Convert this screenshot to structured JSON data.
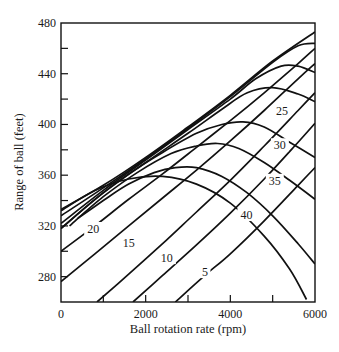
{
  "chart_data": {
    "type": "line",
    "title": "",
    "xlabel": "Ball rotation rate (rpm)",
    "ylabel": "Range of ball (feet)",
    "xlim": [
      0,
      6000
    ],
    "ylim": [
      260,
      480
    ],
    "grid": false,
    "legend": "none (curves labeled inline)",
    "x_ticks": [
      0,
      2000,
      4000,
      6000
    ],
    "x_minor_ticks": [
      1000,
      3000,
      5000
    ],
    "y_ticks": [
      280,
      320,
      360,
      400,
      440,
      480
    ],
    "y_minor_ticks": [
      300,
      340,
      380,
      420,
      460
    ],
    "x_tick_labels": [
      "0",
      "2000",
      "4000",
      "6000"
    ],
    "y_tick_labels": [
      "280",
      "320",
      "360",
      "400",
      "440",
      "480"
    ],
    "series": [
      {
        "name": "arch-top-1",
        "label": "",
        "points": [
          [
            0,
            333
          ],
          [
            1000,
            352
          ],
          [
            2000,
            374
          ],
          [
            3000,
            398
          ],
          [
            4000,
            423
          ],
          [
            5000,
            450
          ],
          [
            6000,
            473
          ]
        ]
      },
      {
        "name": "arch-top-2",
        "label": "",
        "points": [
          [
            0,
            328
          ],
          [
            1000,
            350
          ],
          [
            2000,
            373
          ],
          [
            3000,
            397
          ],
          [
            4000,
            422
          ],
          [
            5000,
            449
          ],
          [
            5600,
            462
          ],
          [
            6000,
            464
          ]
        ]
      },
      {
        "name": "arch-top-3",
        "label": "",
        "points": [
          [
            0,
            322
          ],
          [
            1000,
            348
          ],
          [
            2000,
            372
          ],
          [
            3000,
            396
          ],
          [
            4000,
            420
          ],
          [
            4600,
            436
          ],
          [
            5200,
            446
          ],
          [
            5600,
            446
          ],
          [
            6000,
            441
          ]
        ]
      },
      {
        "name": "arch-top-4",
        "label": "",
        "points": [
          [
            0,
            318
          ],
          [
            1000,
            346
          ],
          [
            2000,
            370
          ],
          [
            3000,
            393
          ],
          [
            3800,
            412
          ],
          [
            4400,
            425
          ],
          [
            5000,
            429
          ],
          [
            5600,
            424
          ],
          [
            6000,
            418
          ]
        ]
      },
      {
        "name": "arch-25",
        "label": "25",
        "points": [
          [
            0,
            318
          ],
          [
            800,
            341
          ],
          [
            1600,
            361
          ],
          [
            2400,
            378
          ],
          [
            3200,
            393
          ],
          [
            3800,
            400
          ],
          [
            4300,
            402
          ],
          [
            4800,
            398
          ],
          [
            5400,
            386
          ],
          [
            6000,
            374
          ]
        ]
      },
      {
        "name": "arch-30",
        "label": "30",
        "points": [
          [
            200,
            320
          ],
          [
            1000,
            343
          ],
          [
            1800,
            362
          ],
          [
            2600,
            377
          ],
          [
            3200,
            383
          ],
          [
            3700,
            385
          ],
          [
            4200,
            381
          ],
          [
            4800,
            370
          ],
          [
            5400,
            356
          ],
          [
            6000,
            341
          ]
        ]
      },
      {
        "name": "arch-35",
        "label": "35",
        "points": [
          [
            400,
            326
          ],
          [
            1000,
            340
          ],
          [
            1600,
            353
          ],
          [
            2200,
            362
          ],
          [
            2700,
            366
          ],
          [
            3200,
            366
          ],
          [
            3800,
            359
          ],
          [
            4400,
            346
          ],
          [
            5000,
            328
          ],
          [
            5600,
            306
          ],
          [
            6000,
            290
          ]
        ]
      },
      {
        "name": "arch-40",
        "label": "40",
        "points": [
          [
            0,
            332
          ],
          [
            800,
            348
          ],
          [
            1600,
            357
          ],
          [
            2400,
            359
          ],
          [
            3200,
            353
          ],
          [
            4000,
            338
          ],
          [
            4800,
            312
          ],
          [
            5400,
            286
          ],
          [
            5800,
            262
          ]
        ]
      },
      {
        "name": "line-20",
        "label": "20",
        "points": [
          [
            0,
            300
          ],
          [
            800,
            320
          ],
          [
            1600,
            341
          ],
          [
            2400,
            361
          ],
          [
            3200,
            382
          ],
          [
            4000,
            403
          ],
          [
            4800,
            425
          ],
          [
            5600,
            448
          ],
          [
            6000,
            460
          ]
        ]
      },
      {
        "name": "line-15",
        "label": "15",
        "points": [
          [
            0,
            276
          ],
          [
            800,
            298
          ],
          [
            1600,
            320
          ],
          [
            2400,
            342
          ],
          [
            3200,
            364
          ],
          [
            4000,
            387
          ],
          [
            4800,
            411
          ],
          [
            5600,
            436
          ],
          [
            6000,
            448
          ]
        ]
      },
      {
        "name": "line-10",
        "label": "10",
        "points": [
          [
            850,
            260
          ],
          [
            1600,
            282
          ],
          [
            2400,
            306
          ],
          [
            3200,
            331
          ],
          [
            4000,
            356
          ],
          [
            4800,
            383
          ],
          [
            5600,
            411
          ],
          [
            6000,
            425
          ]
        ]
      },
      {
        "name": "line-5",
        "label": "5",
        "points": [
          [
            1700,
            260
          ],
          [
            2400,
            281
          ],
          [
            3200,
            305
          ],
          [
            4000,
            330
          ],
          [
            4800,
            357
          ],
          [
            5600,
            386
          ],
          [
            6000,
            401
          ]
        ]
      },
      {
        "name": "line-unlabeled",
        "label": "",
        "points": [
          [
            2700,
            260
          ],
          [
            3400,
            281
          ],
          [
            4000,
            298
          ],
          [
            4800,
            324
          ],
          [
            5600,
            352
          ],
          [
            6000,
            366
          ]
        ]
      }
    ],
    "inline_labels": [
      {
        "text": "20",
        "x": 760,
        "y": 316
      },
      {
        "text": "15",
        "x": 1600,
        "y": 305
      },
      {
        "text": "10",
        "x": 2500,
        "y": 293
      },
      {
        "text": "5",
        "x": 3400,
        "y": 282
      },
      {
        "text": "25",
        "x": 5220,
        "y": 409
      },
      {
        "text": "30",
        "x": 5170,
        "y": 382
      },
      {
        "text": "35",
        "x": 5050,
        "y": 354
      },
      {
        "text": "40",
        "x": 4380,
        "y": 327
      }
    ]
  },
  "axes": {
    "x_title": "Ball rotation rate (rpm)",
    "y_title": "Range of ball (feet)"
  }
}
